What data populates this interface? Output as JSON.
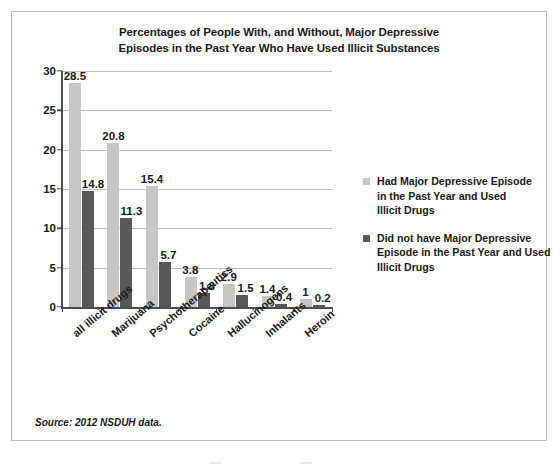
{
  "figure": {
    "title_line1": "Percentages of People With, and Without, Major Depressive",
    "title_line2": "Episodes in the Past Year Who Have Used Illicit Substances",
    "source_note": "Source: 2012 NSDUH data."
  },
  "colors": {
    "series_light": "#c6c6c6",
    "series_dark": "#585858",
    "axis": "#4d4d4d",
    "gridline": "#bfbfbf",
    "border": "#b9b9b9",
    "text": "#1a1a1a"
  },
  "legend": {
    "position": "right",
    "entries": [
      {
        "swatch": "light",
        "lines": [
          "Had Major Depressive Episode",
          "in the Past Year and Used",
          "Illicit Drugs"
        ],
        "full_label": "Had Major Depressive Episode in the Past Year and Used Illicit Drugs"
      },
      {
        "swatch": "dark",
        "lines": [
          "Did not have Major Depressive",
          "Episode in the Past Year and Used",
          "Illicit Drugs"
        ],
        "full_label": "Did not have Major Depressive Episode in the Past Year and Used Illicit Drugs"
      }
    ]
  },
  "axis": {
    "y_ticks": [
      "0",
      "5",
      "10",
      "15",
      "20",
      "25",
      "30"
    ],
    "y_min": 0,
    "y_max": 30,
    "y_step": 5
  },
  "chart_data": {
    "type": "bar",
    "title": "Percentages of People With, and Without, Major Depressive Episodes in the Past Year Who Have Used Illicit Substances",
    "xlabel": "",
    "ylabel": "",
    "ylim": [
      0,
      30
    ],
    "ytick_step": 5,
    "grid": true,
    "legend_position": "right",
    "categories": [
      "all illicit drugs",
      "Marijuana",
      "Psychotherapeutics",
      "Cocaine",
      "Hallucinogens",
      "Inhalants",
      "Heroin"
    ],
    "series": [
      {
        "name": "Had Major Depressive Episode in the Past Year and Used Illicit Drugs",
        "color": "#c6c6c6",
        "values": [
          28.5,
          20.8,
          15.4,
          3.8,
          2.9,
          1.4,
          1
        ],
        "labels": [
          "28.5",
          "20.8",
          "15.4",
          "3.8",
          "2.9",
          "1.4",
          "1"
        ]
      },
      {
        "name": "Did not have Major Depressive Episode in the Past Year and Used Illicit Drugs",
        "color": "#585858",
        "values": [
          14.8,
          11.3,
          5.7,
          1.8,
          1.5,
          0.4,
          0.2
        ],
        "labels": [
          "14.8",
          "11.3",
          "5.7",
          "1.8",
          "1.5",
          "0.4",
          "0.2"
        ]
      }
    ],
    "source": "Source: 2012 NSDUH data."
  }
}
